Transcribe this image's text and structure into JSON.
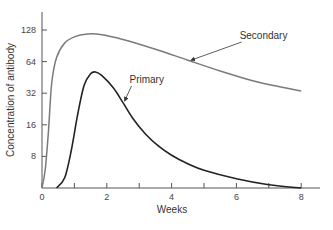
{
  "chart_data": {
    "type": "line",
    "title": "",
    "xlabel": "Weeks",
    "ylabel": "Concentration of antibody",
    "x_ticks": [
      0,
      2,
      4,
      6,
      8
    ],
    "x_minor_ticks": [
      1,
      3,
      5,
      7
    ],
    "y_ticks": [
      8,
      16,
      32,
      64,
      128
    ],
    "y_scale": "log2",
    "xlim": [
      0,
      8.6
    ],
    "ylim": [
      4,
      200
    ],
    "grid": false,
    "legend": null,
    "series": [
      {
        "name": "Secondary",
        "color": "#7a7a7a",
        "points": [
          [
            0,
            4
          ],
          [
            0.1,
            6
          ],
          [
            0.2,
            14
          ],
          [
            0.3,
            40
          ],
          [
            0.45,
            70
          ],
          [
            0.7,
            96
          ],
          [
            1.0,
            110
          ],
          [
            1.4,
            117
          ],
          [
            1.8,
            116
          ],
          [
            2.5,
            104
          ],
          [
            3.5,
            84
          ],
          [
            4.5,
            66
          ],
          [
            5.5,
            52
          ],
          [
            6.5,
            42
          ],
          [
            7.3,
            37
          ],
          [
            8.0,
            33.6
          ]
        ]
      },
      {
        "name": "Primary",
        "color": "#222222",
        "points": [
          [
            0.45,
            4
          ],
          [
            0.7,
            5
          ],
          [
            0.9,
            9
          ],
          [
            1.1,
            20
          ],
          [
            1.3,
            38
          ],
          [
            1.5,
            49
          ],
          [
            1.65,
            51
          ],
          [
            1.85,
            47
          ],
          [
            2.2,
            36
          ],
          [
            2.5,
            26
          ],
          [
            2.8,
            18.5
          ],
          [
            3.2,
            13
          ],
          [
            3.6,
            10
          ],
          [
            4.0,
            8.2
          ],
          [
            4.5,
            6.8
          ],
          [
            5.0,
            5.9
          ],
          [
            6.0,
            4.9
          ],
          [
            7.0,
            4.3
          ],
          [
            8.0,
            4
          ]
        ]
      }
    ],
    "annotations": [
      {
        "text": "Secondary",
        "x": 6.1,
        "y": 105,
        "arrow_to": [
          4.6,
          66
        ]
      },
      {
        "text": "Primary",
        "x": 2.7,
        "y": 40,
        "arrow_to": [
          2.55,
          27
        ]
      }
    ]
  }
}
